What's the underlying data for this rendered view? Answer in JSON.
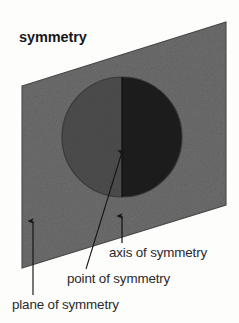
{
  "figure": {
    "title": "symmetry",
    "background_color": "#fdfdfc",
    "plane": {
      "name": "plane of symmetry",
      "fill_color": "#6e6e6e",
      "edge_color": "#4a4a4a",
      "corners": [
        [
          22,
          86
        ],
        [
          226,
          22
        ],
        [
          226,
          205
        ],
        [
          22,
          268
        ]
      ]
    },
    "sphere": {
      "name": "sphere",
      "center": [
        122,
        137
      ],
      "radius": 60,
      "left_half_color": "#474747",
      "right_half_color": "#1b1b1b",
      "outline_color": "#323232"
    },
    "axis_line": {
      "name": "axis of symmetry",
      "x": 122,
      "y_top": 77,
      "y_bottom": 197,
      "color": "#141414"
    }
  },
  "callouts": [
    {
      "id": "axis",
      "label": "axis of symmetry",
      "leader": {
        "x1": 122,
        "y1": 243,
        "x2": 122,
        "y2": 216
      },
      "arrow_direction": "up"
    },
    {
      "id": "point",
      "label": "point of symmetry",
      "leader": {
        "x1": 86,
        "y1": 269,
        "x2": 122,
        "y2": 152
      },
      "arrow_direction": "up-right"
    },
    {
      "id": "plane",
      "label": "plane of symmetry",
      "leader": {
        "x1": 33,
        "y1": 295,
        "x2": 33,
        "y2": 221
      },
      "arrow_direction": "up"
    }
  ]
}
